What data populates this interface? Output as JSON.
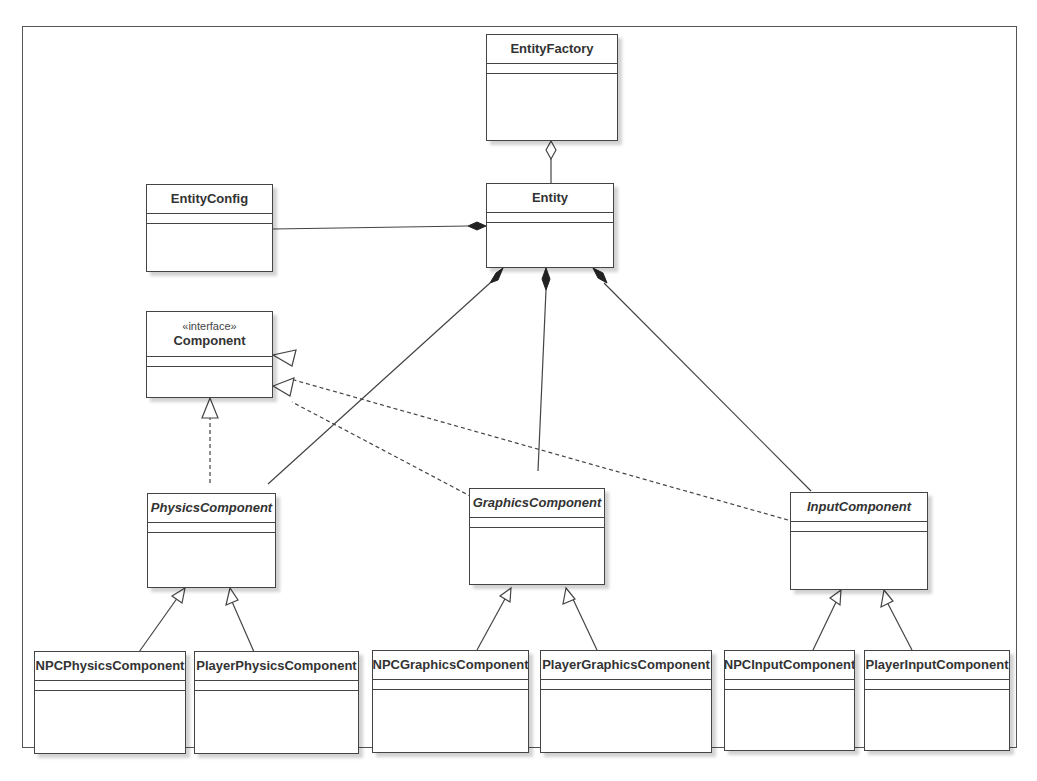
{
  "diagram": {
    "type": "UML class diagram",
    "classes": {
      "entity_factory": {
        "name": "EntityFactory"
      },
      "entity": {
        "name": "Entity"
      },
      "entity_config": {
        "name": "EntityConfig"
      },
      "component": {
        "stereotype": "«interface»",
        "name": "Component"
      },
      "physics_component": {
        "name": "PhysicsComponent",
        "abstract": true
      },
      "graphics_component": {
        "name": "GraphicsComponent",
        "abstract": true
      },
      "input_component": {
        "name": "InputComponent",
        "abstract": true
      },
      "npc_physics_component": {
        "name": "NPCPhysicsComponent"
      },
      "player_physics_component": {
        "name": "PlayerPhysicsComponent"
      },
      "npc_graphics_component": {
        "name": "NPCGraphicsComponent"
      },
      "player_graphics_component": {
        "name": "PlayerGraphicsComponent"
      },
      "npc_input_component": {
        "name": "NPCInputComponent"
      },
      "player_input_component": {
        "name": "PlayerInputComponent"
      }
    },
    "relationships": [
      {
        "type": "aggregation",
        "whole": "EntityFactory",
        "part": "Entity"
      },
      {
        "type": "composition",
        "whole": "Entity",
        "part": "EntityConfig"
      },
      {
        "type": "composition",
        "whole": "Entity",
        "part": "PhysicsComponent"
      },
      {
        "type": "composition",
        "whole": "Entity",
        "part": "GraphicsComponent"
      },
      {
        "type": "composition",
        "whole": "Entity",
        "part": "InputComponent"
      },
      {
        "type": "realization",
        "from": "PhysicsComponent",
        "to": "Component"
      },
      {
        "type": "realization",
        "from": "GraphicsComponent",
        "to": "Component"
      },
      {
        "type": "realization",
        "from": "InputComponent",
        "to": "Component"
      },
      {
        "type": "generalization",
        "from": "NPCPhysicsComponent",
        "to": "PhysicsComponent"
      },
      {
        "type": "generalization",
        "from": "PlayerPhysicsComponent",
        "to": "PhysicsComponent"
      },
      {
        "type": "generalization",
        "from": "NPCGraphicsComponent",
        "to": "GraphicsComponent"
      },
      {
        "type": "generalization",
        "from": "PlayerGraphicsComponent",
        "to": "GraphicsComponent"
      },
      {
        "type": "generalization",
        "from": "NPCInputComponent",
        "to": "InputComponent"
      },
      {
        "type": "generalization",
        "from": "PlayerInputComponent",
        "to": "InputComponent"
      }
    ]
  },
  "colors": {
    "line": "#444444",
    "box_border": "#444444",
    "text": "#333333",
    "background": "#ffffff"
  }
}
